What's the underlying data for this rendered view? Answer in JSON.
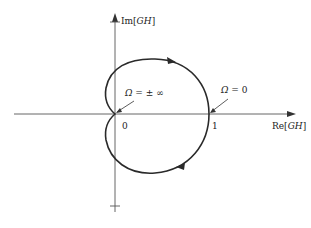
{
  "diagram": {
    "type": "nyquist-plot",
    "axes": {
      "x_label_prefix": "Re[",
      "x_label_var": "GH",
      "x_label_suffix": "]",
      "y_label_prefix": "Im[",
      "y_label_var": "GH",
      "y_label_suffix": "]"
    },
    "ticks": {
      "origin": "0",
      "one": "1"
    },
    "annotations": {
      "omega_infinity_var": "Ω",
      "omega_infinity_rest": " = ± ∞",
      "omega_zero_var": "Ω",
      "omega_zero_rest": " = 0"
    },
    "colors": {
      "curve": "#2a2a2a",
      "axis": "#555555"
    }
  }
}
